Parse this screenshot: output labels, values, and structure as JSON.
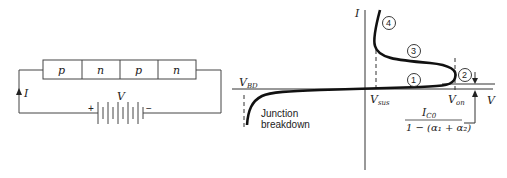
{
  "circuit": {
    "layers": [
      "p",
      "n",
      "p",
      "n"
    ],
    "current_label": "I",
    "voltage_label": "V",
    "plus": "+",
    "minus": "−"
  },
  "graph": {
    "y_axis_label": "I",
    "x_axis_label": "V",
    "v_bd": "V",
    "v_bd_sub": "BD",
    "v_sus": "V",
    "v_sus_sub": "sus",
    "v_on": "V",
    "v_on_sub": "on",
    "junction_1": "Junction",
    "junction_2": "breakdown",
    "frac_num": "I",
    "frac_num_sub": "C0",
    "frac_den": "1 − (α₁ + α₂)",
    "regions": [
      "1",
      "2",
      "3",
      "4"
    ]
  }
}
